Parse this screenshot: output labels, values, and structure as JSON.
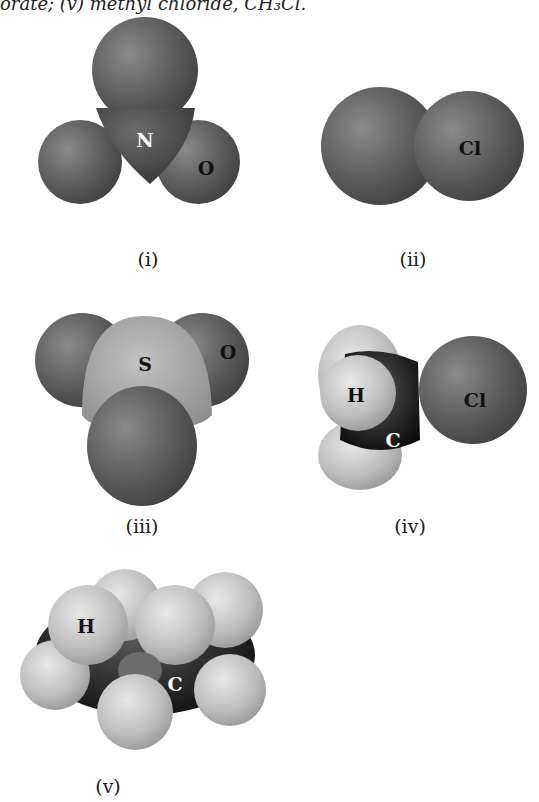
{
  "caption_fragment": "orate; (v) methyl chloride, CH₃Cl.",
  "figures": [
    {
      "id": "i",
      "label": "(i)",
      "atoms": [
        "N",
        "O"
      ]
    },
    {
      "id": "ii",
      "label": "(ii)",
      "atoms": [
        "Cl"
      ]
    },
    {
      "id": "iii",
      "label": "(iii)",
      "atoms": [
        "S",
        "O"
      ]
    },
    {
      "id": "iv",
      "label": "(iv)",
      "atoms": [
        "H",
        "C",
        "Cl"
      ]
    },
    {
      "id": "v",
      "label": "(v)",
      "atoms": [
        "H",
        "C"
      ]
    }
  ]
}
